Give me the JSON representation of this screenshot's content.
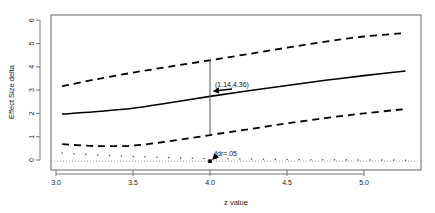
{
  "chart_data": {
    "type": "line",
    "title": "",
    "xlabel": "z value",
    "ylabel": "Effect Size delta",
    "xlim": [
      2.97,
      5.36
    ],
    "ylim": [
      -0.25,
      6.25
    ],
    "grid": false,
    "legend": null,
    "x_ticks": [
      "3.0",
      "3.5",
      "4.0",
      "4.5",
      "5.0"
    ],
    "x_tick_values": [
      3.0,
      3.5,
      4.0,
      4.5,
      5.0
    ],
    "y_ticks": [
      "0",
      "1",
      "2",
      "3",
      "4",
      "5",
      "6"
    ],
    "y_tick_values": [
      0,
      1,
      2,
      3,
      4,
      5,
      6
    ],
    "x": [
      3.04,
      3.25,
      3.5,
      3.75,
      4.0,
      4.25,
      4.5,
      4.75,
      5.0,
      5.27
    ],
    "series": [
      {
        "name": "upper bound",
        "style": "dashed",
        "color": "#000000",
        "values": [
          3.17,
          3.45,
          3.75,
          4.02,
          4.28,
          4.55,
          4.82,
          5.08,
          5.3,
          5.45
        ]
      },
      {
        "name": "estimate",
        "style": "solid",
        "color": "#000000",
        "values": [
          1.97,
          2.07,
          2.22,
          2.47,
          2.73,
          2.97,
          3.2,
          3.42,
          3.62,
          3.82
        ]
      },
      {
        "name": "lower bound",
        "style": "dashed",
        "color": "#000000",
        "values": [
          0.68,
          0.6,
          0.62,
          0.82,
          1.07,
          1.32,
          1.57,
          1.8,
          2.0,
          2.19
        ]
      },
      {
        "name": "fdr points",
        "style": "points",
        "color": "#555555",
        "values": [
          0.3,
          0.22,
          0.15,
          0.1,
          0.06,
          0.04,
          0.02,
          0.01,
          0.0,
          -0.01
        ]
      }
    ],
    "reference_line": {
      "y": -0.05,
      "style": "dotted",
      "color": "#888888"
    },
    "interval_segment": {
      "x": 4.0,
      "y_low": 1.07,
      "y_high": 4.28,
      "color": "#555555"
    },
    "annotations": [
      {
        "text": "(1.14,4.36)",
        "arrow_to": [
          4.0,
          2.85
        ]
      },
      {
        "text": "fdr=.05",
        "arrow_to": [
          4.0,
          -0.05
        ]
      }
    ]
  }
}
